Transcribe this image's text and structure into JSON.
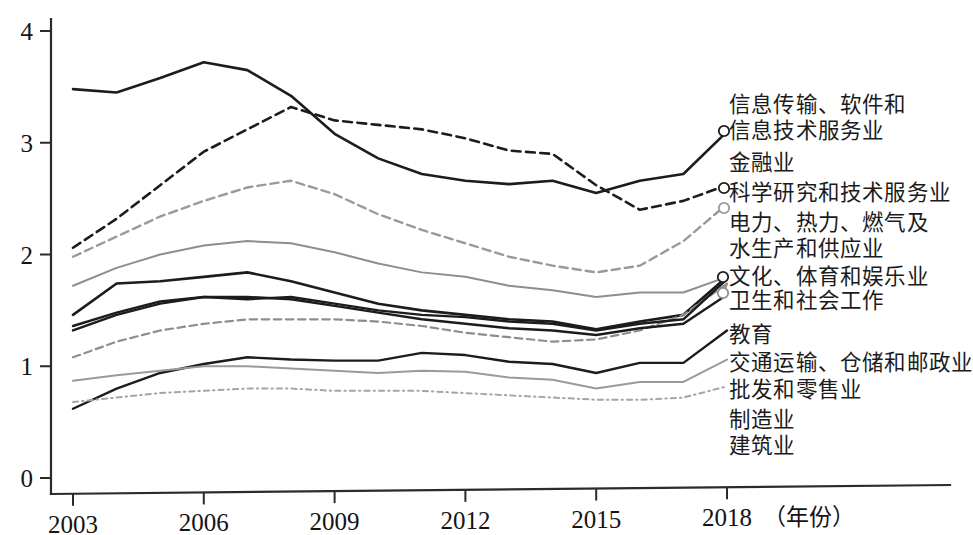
{
  "chart_data": {
    "type": "line",
    "title": "",
    "xlabel": "年份",
    "ylabel": "",
    "xlim": [
      2003,
      2018
    ],
    "ylim": [
      0,
      4
    ],
    "grid": false,
    "legend_position": "right-inline-labels",
    "x": [
      2003,
      2004,
      2005,
      2006,
      2007,
      2008,
      2009,
      2010,
      2011,
      2012,
      2013,
      2014,
      2015,
      2016,
      2017,
      2018
    ],
    "xticks": [
      "2003",
      "2006",
      "2009",
      "2012",
      "2015",
      "2018"
    ],
    "xtick_values": [
      2003,
      2006,
      2009,
      2012,
      2015,
      2018
    ],
    "yticks": [
      "0",
      "1",
      "2",
      "3",
      "4"
    ],
    "ytick_values": [
      0,
      1,
      2,
      3,
      4
    ],
    "x_axis_unit_note": "（年份）",
    "series": [
      {
        "name": "信息传输、软件和信息技术服务业",
        "label_lines": [
          "信息传输、软件和",
          "信息技术服务业"
        ],
        "style": "solid",
        "color": "#1c1c1c",
        "width": 2.6,
        "marker_end": true,
        "values": [
          3.48,
          3.45,
          3.58,
          3.72,
          3.65,
          3.42,
          3.08,
          2.86,
          2.72,
          2.66,
          2.63,
          2.66,
          2.55,
          2.66,
          2.72,
          3.1
        ]
      },
      {
        "name": "金融业",
        "label_lines": [
          "金融业"
        ],
        "style": "dashed",
        "color": "#1c1c1c",
        "width": 2.6,
        "marker_end": true,
        "values": [
          2.06,
          2.32,
          2.62,
          2.92,
          3.12,
          3.32,
          3.2,
          3.16,
          3.12,
          3.04,
          2.93,
          2.9,
          2.62,
          2.4,
          2.48,
          2.62
        ]
      },
      {
        "name": "科学研究和技术服务业",
        "label_lines": [
          "科学研究和技术服务业"
        ],
        "style": "dashed",
        "color": "#9a9a9a",
        "width": 2.4,
        "marker_end": true,
        "values": [
          1.98,
          2.16,
          2.34,
          2.48,
          2.6,
          2.66,
          2.54,
          2.36,
          2.22,
          2.1,
          1.98,
          1.9,
          1.84,
          1.9,
          2.12,
          2.45
        ]
      },
      {
        "name": "电力、热力、燃气及水生产和供应业",
        "label_lines": [
          "电力、热力、燃气及",
          "水生产和供应业"
        ],
        "style": "solid",
        "color": "#8e8e8e",
        "width": 2.0,
        "marker_end": false,
        "values": [
          1.72,
          1.88,
          2.0,
          2.08,
          2.12,
          2.1,
          2.02,
          1.92,
          1.84,
          1.8,
          1.72,
          1.68,
          1.62,
          1.66,
          1.66,
          1.8
        ]
      },
      {
        "name": "文化、体育和娱乐业",
        "label_lines": [
          "文化、体育和娱乐业"
        ],
        "style": "solid",
        "color": "#1c1c1c",
        "width": 2.6,
        "marker_end": true,
        "values": [
          1.46,
          1.74,
          1.76,
          1.8,
          1.84,
          1.76,
          1.66,
          1.56,
          1.5,
          1.46,
          1.42,
          1.4,
          1.33,
          1.4,
          1.46,
          1.8
        ]
      },
      {
        "name": "卫生和社会工作",
        "label_lines": [
          "卫生和社会工作"
        ],
        "style": "dashed",
        "color": "#8e8e8e",
        "width": 2.2,
        "marker_end": true,
        "values": [
          1.08,
          1.22,
          1.32,
          1.38,
          1.42,
          1.42,
          1.42,
          1.4,
          1.36,
          1.3,
          1.26,
          1.22,
          1.24,
          1.32,
          1.46,
          1.74
        ]
      },
      {
        "name": "教育",
        "label_lines": [
          "教育"
        ],
        "style": "solid",
        "color": "#1c1c1c",
        "width": 2.4,
        "marker_end": false,
        "values": [
          1.36,
          1.48,
          1.58,
          1.62,
          1.6,
          1.62,
          1.56,
          1.5,
          1.46,
          1.44,
          1.4,
          1.38,
          1.32,
          1.38,
          1.42,
          1.78
        ]
      },
      {
        "name": "交通运输、仓储和邮政业",
        "label_lines": [
          "交通运输、仓储和邮政业"
        ],
        "style": "solid",
        "color": "#1c1c1c",
        "width": 2.4,
        "marker_end": false,
        "values": [
          1.32,
          1.46,
          1.56,
          1.62,
          1.62,
          1.6,
          1.54,
          1.48,
          1.42,
          1.38,
          1.34,
          1.32,
          1.28,
          1.34,
          1.38,
          1.64
        ]
      },
      {
        "name": "批发和零售业",
        "label_lines": [
          "批发和零售业"
        ],
        "style": "solid",
        "color": "#1c1c1c",
        "width": 2.4,
        "marker_end": false,
        "values": [
          0.62,
          0.8,
          0.94,
          1.02,
          1.08,
          1.06,
          1.05,
          1.05,
          1.12,
          1.1,
          1.04,
          1.02,
          0.94,
          1.03,
          1.03,
          1.32
        ]
      },
      {
        "name": "制造业",
        "label_lines": [
          "制造业"
        ],
        "style": "solid",
        "color": "#9a9a9a",
        "width": 2.0,
        "marker_end": false,
        "values": [
          0.87,
          0.92,
          0.96,
          1.0,
          1.0,
          0.98,
          0.96,
          0.94,
          0.96,
          0.95,
          0.9,
          0.88,
          0.8,
          0.86,
          0.86,
          1.06
        ]
      },
      {
        "name": "建筑业",
        "label_lines": [
          "建筑业"
        ],
        "style": "dashdot",
        "color": "#a5a5a5",
        "width": 2.0,
        "marker_end": false,
        "values": [
          0.68,
          0.72,
          0.76,
          0.78,
          0.8,
          0.8,
          0.78,
          0.78,
          0.78,
          0.76,
          0.74,
          0.72,
          0.7,
          0.7,
          0.72,
          0.82
        ]
      }
    ]
  },
  "axis": {
    "y_labels": [
      "4",
      "3",
      "2",
      "1",
      "0"
    ],
    "x_labels": [
      "2003",
      "2006",
      "2009",
      "2012",
      "2015",
      "2018"
    ],
    "x_unit": "（年份）"
  },
  "legend": {
    "entries": [
      {
        "id": "info-tech",
        "line1": "信息传输、软件和",
        "line2": "信息技术服务业"
      },
      {
        "id": "finance",
        "line1": "金融业",
        "line2": ""
      },
      {
        "id": "science-tech",
        "line1": "科学研究和技术服务业",
        "line2": ""
      },
      {
        "id": "utilities",
        "line1": "电力、热力、燃气及",
        "line2": "水生产和供应业"
      },
      {
        "id": "culture-sports",
        "line1": "文化、体育和娱乐业",
        "line2": ""
      },
      {
        "id": "health-social",
        "line1": "卫生和社会工作",
        "line2": ""
      },
      {
        "id": "education",
        "line1": "教育",
        "line2": ""
      },
      {
        "id": "transport",
        "line1": "交通运输、仓储和邮政业",
        "line2": ""
      },
      {
        "id": "wholesale-retail",
        "line1": "批发和零售业",
        "line2": ""
      },
      {
        "id": "manufacturing",
        "line1": "制造业",
        "line2": ""
      },
      {
        "id": "construction",
        "line1": "建筑业",
        "line2": ""
      }
    ]
  }
}
